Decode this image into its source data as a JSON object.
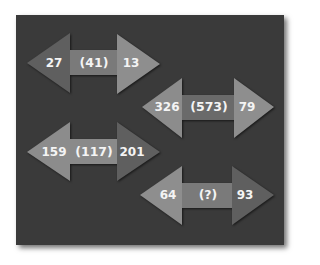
{
  "puzzle": {
    "background_color": "#3a3a3a",
    "arrows": [
      {
        "left": "27",
        "middle": "(41)",
        "right": "13",
        "colors": {
          "left_head": "#5f5f5f",
          "bar": "#7a7a7a",
          "right_head": "#8e8e8e"
        }
      },
      {
        "left": "326",
        "middle": "(573)",
        "right": "79",
        "colors": {
          "left_head": "#8c8c8c",
          "bar": "#6a6a6a",
          "right_head": "#8e8e8e"
        }
      },
      {
        "left": "159",
        "middle": "(117)",
        "right": "201",
        "colors": {
          "left_head": "#8c8c8c",
          "bar": "#8a8a8a",
          "right_head": "#5f5f5f"
        }
      },
      {
        "left": "64",
        "middle": "(?)",
        "right": "93",
        "colors": {
          "left_head": "#8e8e8e",
          "bar": "#7a7a7a",
          "right_head": "#5f5f5f"
        }
      }
    ]
  }
}
